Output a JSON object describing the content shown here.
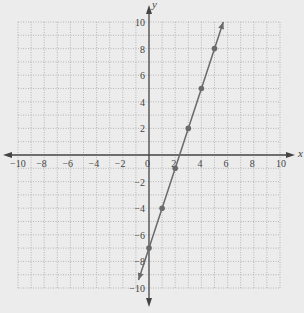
{
  "chart_data": {
    "type": "line",
    "title": "",
    "xlabel": "x",
    "ylabel": "y",
    "xlim": [
      -10,
      10
    ],
    "ylim": [
      -10,
      10
    ],
    "grid": true,
    "grid_step": 1,
    "x_ticks": [
      -10,
      -8,
      -6,
      -4,
      -2,
      0,
      2,
      4,
      6,
      8,
      10
    ],
    "y_ticks": [
      -10,
      -8,
      -6,
      -4,
      -2,
      2,
      4,
      6,
      8,
      10
    ],
    "x_tick_labels": [
      "−10",
      "−8",
      "−6",
      "−4",
      "−2",
      "0",
      "2",
      "4",
      "6",
      "8",
      "10"
    ],
    "y_tick_labels": [
      "−10",
      "−8",
      "−6",
      "−4",
      "−2",
      "2",
      "4",
      "6",
      "8",
      "10"
    ],
    "series": [
      {
        "name": "y = 3x - 7",
        "equation": "y = 3x - 7",
        "points": [
          [
            0,
            -7
          ],
          [
            1,
            -4
          ],
          [
            2,
            -1
          ],
          [
            3,
            2
          ],
          [
            4,
            5
          ],
          [
            5,
            8
          ]
        ],
        "line_start": [
          -0.8,
          -9.4
        ],
        "line_end": [
          5.67,
          10
        ],
        "arrows_both_ends": true
      }
    ],
    "legend": null
  },
  "colors": {
    "background": "#ececec",
    "grid": "#a8a8a8",
    "axis": "#444444",
    "line": "#6a6a6a",
    "point": "#6a6a6a"
  }
}
